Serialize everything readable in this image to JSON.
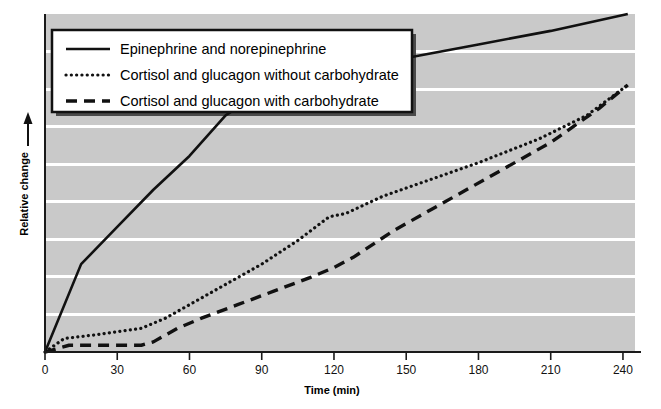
{
  "chart_data": {
    "type": "line",
    "title": "",
    "subtitle": "",
    "xlabel": "Time (min)",
    "ylabel": "Relative change",
    "xlim": [
      0,
      245
    ],
    "ylim": [
      0,
      100
    ],
    "xticks": [
      "0",
      "30",
      "60",
      "90",
      "120",
      "150",
      "180",
      "210",
      "240"
    ],
    "xtick_values": [
      0,
      30,
      60,
      90,
      120,
      150,
      180,
      210,
      240
    ],
    "yticks": [],
    "grid": "horizontal",
    "legend_position": "top-left",
    "background": "#c9c9c9",
    "plot_background": "#c9c9c9",
    "gridline_color": "#ffffff",
    "axis_color": "#1a1a1a",
    "series": [
      {
        "name": "Epinephrine and norepinephrine",
        "style": "solid",
        "color": "#111111",
        "x": [
          0,
          15,
          30,
          45,
          60,
          75,
          90,
          105,
          120,
          150,
          180,
          210,
          242
        ],
        "values": [
          0,
          26,
          37,
          48,
          58,
          70,
          77,
          80,
          83,
          87,
          91,
          95,
          100
        ]
      },
      {
        "name": "Cortisol and glucagon without carbohydrate",
        "style": "dotted",
        "color": "#111111",
        "x": [
          0,
          8,
          20,
          30,
          40,
          50,
          60,
          75,
          90,
          105,
          118,
          125,
          140,
          160,
          180,
          205,
          225,
          242
        ],
        "values": [
          0,
          4,
          5,
          6,
          7,
          10,
          14,
          20,
          26,
          33,
          40,
          41,
          46,
          51,
          56,
          63,
          70,
          79
        ]
      },
      {
        "name": "Cortisol and glucagon with carbohydrate",
        "style": "dashed",
        "color": "#111111",
        "x": [
          0,
          10,
          25,
          40,
          45,
          55,
          65,
          80,
          95,
          110,
          120,
          128,
          145,
          165,
          185,
          210,
          230,
          242
        ],
        "values": [
          0,
          2,
          2,
          2,
          3,
          7,
          10,
          14,
          18,
          22,
          25,
          28,
          36,
          44,
          52,
          62,
          72,
          79
        ]
      }
    ]
  },
  "legend": {
    "items": [
      {
        "label": "Epinephrine and norepinephrine",
        "style": "solid"
      },
      {
        "label": "Cortisol and glucagon without carbohydrate",
        "style": "dotted"
      },
      {
        "label": "Cortisol and glucagon with carbohydrate",
        "style": "dashed"
      }
    ]
  },
  "axes": {
    "x_axis_title": "Time (min)",
    "y_axis_title": "Relative change"
  }
}
